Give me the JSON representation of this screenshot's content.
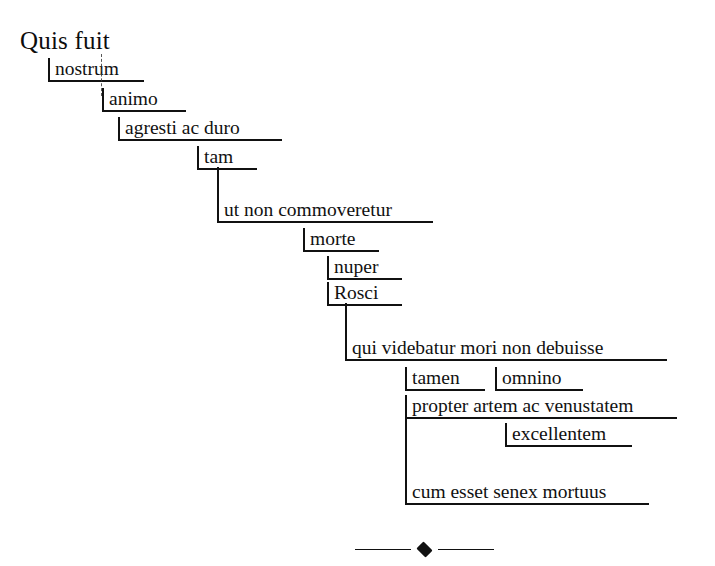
{
  "document": {
    "title": "Quis fuit nostrum — cascade sentence diagram",
    "language": "Latin",
    "background_color": "#ffffff",
    "ink_color": "#111111"
  },
  "root": {
    "text": "Quis fuit",
    "x": 20,
    "y": 28,
    "font_size": 25
  },
  "steps": [
    {
      "id": "nostrum",
      "text": "nostrum",
      "x": 48,
      "y": 58,
      "width": 96,
      "font_size": 19.5
    },
    {
      "id": "animo",
      "text": "animo",
      "x": 102,
      "y": 88,
      "width": 84,
      "font_size": 19.5
    },
    {
      "id": "agresti",
      "text": "agresti ac duro",
      "x": 118,
      "y": 117,
      "width": 164,
      "font_size": 19.5
    },
    {
      "id": "tam",
      "text": "tam",
      "x": 197,
      "y": 146,
      "width": 60,
      "font_size": 19.5
    },
    {
      "id": "ut-non",
      "text": "ut non commoveretur",
      "x": 217,
      "y": 199,
      "width": 216,
      "font_size": 19.5
    },
    {
      "id": "morte",
      "text": "morte",
      "x": 303,
      "y": 228,
      "width": 76,
      "font_size": 19.5
    },
    {
      "id": "nuper",
      "text": "nuper",
      "x": 327,
      "y": 256,
      "width": 75,
      "font_size": 19.5
    },
    {
      "id": "rosci",
      "text": "Rosci",
      "x": 327,
      "y": 282,
      "width": 75,
      "font_size": 19.5
    },
    {
      "id": "qui-videbatur",
      "text": "qui videbatur mori non debuisse",
      "x": 345,
      "y": 337,
      "width": 322,
      "font_size": 19.5
    },
    {
      "id": "tamen",
      "text": "tamen",
      "x": 405,
      "y": 367,
      "width": 80,
      "font_size": 19.5
    },
    {
      "id": "omnino",
      "text": "omnino",
      "x": 495,
      "y": 367,
      "width": 88,
      "font_size": 19.5
    },
    {
      "id": "propter",
      "text": "propter artem ac venustatem",
      "x": 405,
      "y": 395,
      "width": 272,
      "font_size": 19.5
    },
    {
      "id": "excellentem",
      "text": "excellentem",
      "x": 505,
      "y": 423,
      "width": 127,
      "font_size": 19.5
    },
    {
      "id": "cum-esset",
      "text": "cum esset senex mortuus",
      "x": 405,
      "y": 481,
      "width": 244,
      "font_size": 19.5
    }
  ],
  "connectors": [
    {
      "id": "tam-to-ut",
      "kind": "vertical",
      "x": 217,
      "y": 167,
      "length": 34
    },
    {
      "id": "rosci-to-qui",
      "kind": "vertical",
      "x": 345,
      "y": 303,
      "length": 36
    },
    {
      "id": "propter-to-cum",
      "kind": "vertical",
      "x": 405,
      "y": 416,
      "length": 67
    },
    {
      "id": "nostrum-guide",
      "kind": "dashed",
      "x": 101,
      "y": 54,
      "length": 42
    }
  ],
  "ornament": {
    "name": "diamond-divider",
    "x": 355,
    "y": 543,
    "rule_length": 56,
    "diamond_glyph": "diamond"
  }
}
